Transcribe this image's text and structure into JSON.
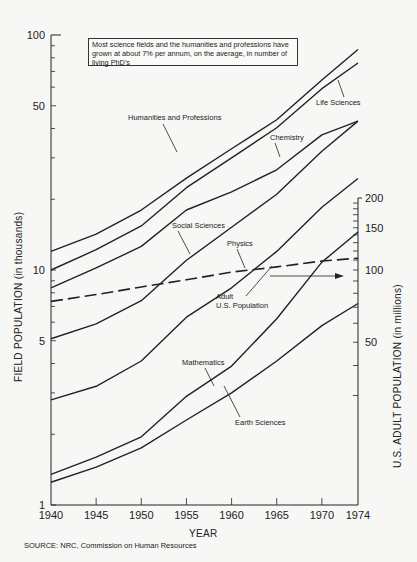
{
  "chart_data": {
    "type": "line",
    "title": "",
    "annotation": "Most science fields and the humanities and professions have grown at about 7% per annum, on the average, in number of living PhD's",
    "xlabel": "YEAR",
    "ylabel": "FIELD POPULATION (in thousands)",
    "y2label": "U.S. ADULT POPULATION (in millions)",
    "x": [
      1940,
      1945,
      1950,
      1955,
      1960,
      1965,
      1970,
      1974
    ],
    "x_ticks": [
      "1940",
      "1945",
      "1950",
      "1955",
      "1960",
      "1965",
      "1970",
      "1974"
    ],
    "y_scale": "log",
    "ylim": [
      1,
      100
    ],
    "y_ticks": [
      "1",
      "5",
      "10",
      "50",
      "100"
    ],
    "y2_scale": "log",
    "y2_ticks": [
      "50",
      "100",
      "150",
      "200"
    ],
    "grid": false,
    "series": [
      {
        "name": "Humanities and Professions",
        "axis": "left",
        "style": "solid",
        "values": [
          12.0,
          14.2,
          18.0,
          24.6,
          32.8,
          43.6,
          64.3,
          86.8
        ]
      },
      {
        "name": "Life Sciences",
        "axis": "left",
        "style": "solid",
        "values": [
          10.0,
          12.2,
          15.4,
          22.4,
          30.0,
          40.3,
          59.1,
          76.0
        ]
      },
      {
        "name": "Chemistry",
        "axis": "left",
        "style": "solid",
        "values": [
          8.4,
          10.2,
          12.6,
          18.0,
          21.5,
          26.7,
          37.6,
          43.0
        ]
      },
      {
        "name": "Social Sciences",
        "axis": "left",
        "style": "solid",
        "values": [
          5.1,
          5.9,
          7.4,
          11.0,
          15.2,
          21.0,
          32.0,
          43.0
        ]
      },
      {
        "name": "Physics",
        "axis": "left",
        "style": "solid",
        "values": [
          2.8,
          3.2,
          4.1,
          6.3,
          8.4,
          12.0,
          18.5,
          24.5
        ]
      },
      {
        "name": "Mathematics",
        "axis": "left",
        "style": "solid",
        "values": [
          1.35,
          1.6,
          1.95,
          2.9,
          3.9,
          6.2,
          10.8,
          14.5
        ]
      },
      {
        "name": "Earth Sciences",
        "axis": "left",
        "style": "solid",
        "values": [
          1.25,
          1.45,
          1.75,
          2.3,
          3.0,
          4.1,
          5.8,
          7.2
        ]
      },
      {
        "name": "Adult U.S. Population",
        "axis": "right",
        "style": "dashed",
        "values": [
          74,
          79,
          85,
          91,
          98,
          103,
          109,
          112
        ]
      }
    ],
    "source": "SOURCE: NRC, Commission on Human Resources"
  },
  "labels": {
    "note": "Most science fields and the humanities and professions have grown at about 7% per annum, on the average, in number of living PhD's",
    "humanities": "Humanities and Professions",
    "life": "Life Sciences",
    "chemistry": "Chemistry",
    "social": "Social Sciences",
    "physics": "Physics",
    "adult1": "Adult",
    "adult2": "U.S. Population",
    "math": "Mathematics",
    "earth": "Earth Sciences",
    "xlabel": "YEAR",
    "ylabel": "FIELD POPULATION (in thousands)",
    "y2label": "U.S. ADULT POPULATION (in millions)",
    "source": "SOURCE: NRC, Commission on Human Resources"
  },
  "colors": {
    "ink": "#222222",
    "paper": "#f7f7f5"
  }
}
